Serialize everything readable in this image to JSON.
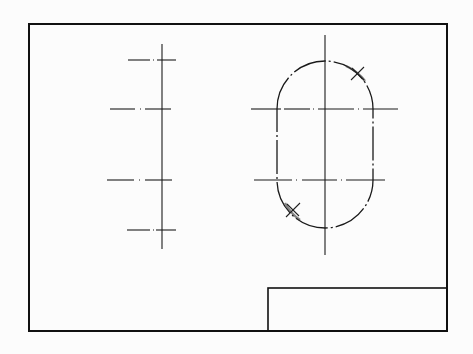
{
  "drawing": {
    "type": "technical-drawing",
    "colors": {
      "background": "#fcfcfc",
      "line": "#111111"
    },
    "frame": {
      "x": 29,
      "y": 24,
      "width": 418,
      "height": 307
    },
    "title_block": {
      "x": 268,
      "y": 288,
      "width": 179,
      "height": 43
    },
    "left_view": {
      "axis": {
        "x": 162,
        "y1": 44,
        "y2": 249
      },
      "ticks": [
        {
          "y": 60,
          "x1": 128,
          "x2": 176
        },
        {
          "y": 109,
          "x1": 110,
          "x2": 171
        },
        {
          "y": 180,
          "x1": 107,
          "x2": 172
        },
        {
          "y": 230,
          "x1": 127,
          "x2": 176
        }
      ]
    },
    "right_view": {
      "shape": "stadium-slot",
      "center_x": 325,
      "left_x": 277,
      "right_x": 373,
      "top_arc_center_y": 109,
      "bottom_arc_center_y": 180,
      "radius": 48,
      "vertical_axis": {
        "x": 325,
        "y1": 35,
        "y2": 255
      },
      "horizontal_axes": [
        {
          "y": 109,
          "x1": 251,
          "x2": 398
        },
        {
          "y": 180,
          "x1": 254,
          "x2": 385
        }
      ],
      "markers": [
        {
          "label": "x-marker-top-right",
          "x": 358,
          "y": 74
        },
        {
          "label": "x-marker-bottom-left",
          "x": 292,
          "y": 210
        }
      ]
    }
  }
}
